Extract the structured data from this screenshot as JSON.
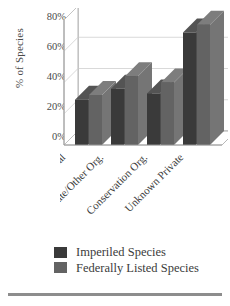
{
  "chart_data": {
    "type": "bar",
    "title": "",
    "subtitle": "",
    "xlabel": "",
    "ylabel": "% of Species",
    "ylim": [
      0,
      80
    ],
    "yticks": [
      0,
      20,
      40,
      60,
      80
    ],
    "ytick_labels": [
      "0%",
      "20%",
      "40%",
      "60%",
      "80%"
    ],
    "grid": true,
    "legend_position": "bottom",
    "three_d": true,
    "categories": [
      "Individual",
      "Corporate/Other Org.",
      "Conservation Org.",
      "Unknown Private"
    ],
    "series": [
      {
        "name": "Imperiled Species",
        "color": "#3a3a3a",
        "values": [
          29,
          36,
          33,
          72
        ]
      },
      {
        "name": "Federally Listed Species",
        "color": "#636363",
        "values": [
          32,
          44,
          40,
          77
        ]
      }
    ]
  },
  "axis": {
    "y_title": "% of Species",
    "y_tick_0": "0%",
    "y_tick_1": "20%",
    "y_tick_2": "40%",
    "y_tick_3": "60%",
    "y_tick_4": "80%"
  },
  "categories": {
    "c0": "Individual",
    "c1": "Corporate/Other Org.",
    "c2": "Conservation Org.",
    "c3": "Unknown Private"
  },
  "legend": {
    "item0_label": "Imperiled Species",
    "item0_color": "#3a3a3a",
    "item1_label": "Federally Listed Species",
    "item1_color": "#636363"
  },
  "colors": {
    "bar_dark": "#3a3a3a",
    "bar_dark_side": "#4d4d4d",
    "bar_dark_top": "#545454",
    "bar_light": "#636363",
    "bar_light_side": "#757575",
    "bar_light_top": "#7d7d7d",
    "grid": "#c9c9c9",
    "axis": "#9a9a9a",
    "text": "#3b3b3b",
    "rule": "#8d8d8d"
  }
}
